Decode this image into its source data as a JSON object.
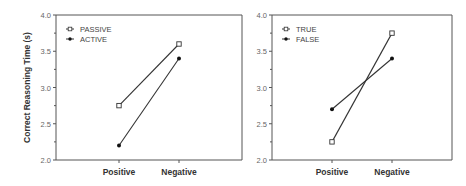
{
  "chart_data": [
    {
      "type": "line",
      "title": "",
      "xlabel": "",
      "ylabel": "Correct Reasoning Time (s)",
      "ylim": [
        2.0,
        4.0
      ],
      "yticks": [
        "2.0",
        "2.5",
        "3.0",
        "3.5",
        "4.0"
      ],
      "categories": [
        "Positive",
        "Negative"
      ],
      "legend_position": "upper-left",
      "grid": false,
      "series": [
        {
          "name": "PASSIVE",
          "marker": "open-square",
          "values": [
            2.75,
            3.6
          ]
        },
        {
          "name": "ACTIVE",
          "marker": "filled-diamond",
          "values": [
            2.2,
            3.4
          ]
        }
      ]
    },
    {
      "type": "line",
      "title": "",
      "xlabel": "",
      "ylabel": "",
      "ylim": [
        2.0,
        4.0
      ],
      "yticks": [
        "2.0",
        "2.5",
        "3.0",
        "3.5",
        "4.0"
      ],
      "categories": [
        "Positive",
        "Negative"
      ],
      "legend_position": "upper-left",
      "grid": false,
      "series": [
        {
          "name": "TRUE",
          "marker": "open-square",
          "values": [
            2.25,
            3.75
          ]
        },
        {
          "name": "FALSE",
          "marker": "filled-diamond",
          "values": [
            2.7,
            3.4
          ]
        }
      ]
    }
  ],
  "colors": {
    "line": "#333333",
    "axis": "#555555",
    "text": "#333333"
  }
}
